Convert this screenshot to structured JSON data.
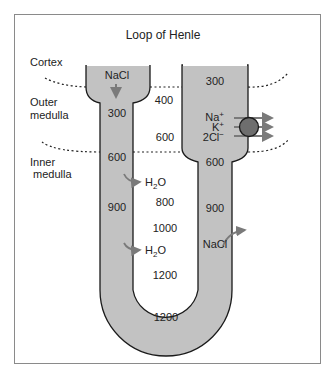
{
  "title": "Loop of Henle",
  "regions": {
    "cortex": "Cortex",
    "outer_medulla_1": "Outer",
    "outer_medulla_2": "medulla",
    "inner_medulla_1": "Inner",
    "inner_medulla_2": "medulla"
  },
  "descending_limb": {
    "solute": "NaCl",
    "values": [
      "300",
      "600",
      "900"
    ]
  },
  "interstitium": {
    "values": [
      "400",
      "600",
      "800",
      "1000",
      "1200"
    ],
    "water_1": "H",
    "water_2": "H",
    "water_sub": "2",
    "water_o": "O"
  },
  "ascending_limb": {
    "values": [
      "300",
      "600",
      "900"
    ],
    "transporter_ions": {
      "na": "Na",
      "k": "K",
      "cl": "2Cl",
      "plus": "+",
      "minus": "−"
    },
    "solute": "NaCl"
  },
  "bend": {
    "value": "1200"
  },
  "colors": {
    "tube_fill": "#c2c2c2",
    "outline": "#1a1a1a",
    "arrow": "#7a7a7a",
    "transporter": "#6e6e6e",
    "frame_border": "#8a8a8a"
  }
}
